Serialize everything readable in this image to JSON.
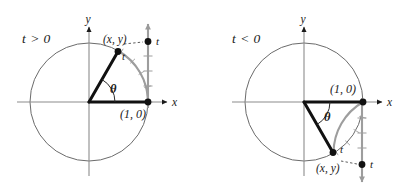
{
  "figure": {
    "background": "#ffffff",
    "ink": "#1a1a1a",
    "gray": "#8c8c8c",
    "light_gray": "#a8a8a8"
  },
  "panels": [
    {
      "id": "left",
      "condition_label": "t > 0",
      "axis_x_label": "x",
      "axis_y_label": "y",
      "angle_label": "θ",
      "point_label": "(x, y)",
      "arc_label": "t",
      "numberline_label": "t",
      "intercept_label": "(1, 0)",
      "center": {
        "x": 89,
        "y": 102
      },
      "radius": 59,
      "terminal_point": {
        "x": 118,
        "y": 51
      },
      "terminal_angle_deg": 60,
      "numberline_x": 148,
      "numberline_dot_y": 41,
      "numberline_top_y": 24,
      "arc_direction": "counterclockwise"
    },
    {
      "id": "right",
      "condition_label": "t < 0",
      "axis_x_label": "x",
      "axis_y_label": "y",
      "angle_label": "θ",
      "point_label": "(x, y)",
      "arc_label": "t",
      "numberline_label": "t",
      "intercept_label": "(1, 0)",
      "center": {
        "x": 304,
        "y": 102
      },
      "radius": 59,
      "terminal_point": {
        "x": 333,
        "y": 153
      },
      "terminal_angle_deg": -60,
      "numberline_x": 362,
      "numberline_dot_y": 165,
      "numberline_bottom_y": 182,
      "arc_direction": "clockwise"
    }
  ]
}
